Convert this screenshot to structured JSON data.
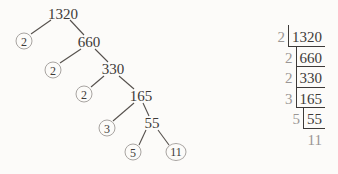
{
  "colors": {
    "bg": "#fcfbf9",
    "dark": "#3d3a38",
    "muted": "#9a9694",
    "line": "#55504c",
    "circle": "#a8a4a1"
  },
  "factor_tree": {
    "number": "1320",
    "prime_factors": [
      "2",
      "2",
      "2",
      "3",
      "5",
      "11"
    ],
    "nodes": [
      {
        "label": "1320",
        "kind": "composite"
      },
      {
        "label": "2",
        "kind": "prime"
      },
      {
        "label": "660",
        "kind": "composite"
      },
      {
        "label": "2",
        "kind": "prime"
      },
      {
        "label": "330",
        "kind": "composite"
      },
      {
        "label": "2",
        "kind": "prime"
      },
      {
        "label": "165",
        "kind": "composite"
      },
      {
        "label": "3",
        "kind": "prime"
      },
      {
        "label": "55",
        "kind": "composite"
      },
      {
        "label": "5",
        "kind": "prime"
      },
      {
        "label": "11",
        "kind": "prime"
      }
    ]
  },
  "division_ladder": {
    "rows": [
      {
        "divisor": "2",
        "dividend": "1320"
      },
      {
        "divisor": "2",
        "dividend": "660"
      },
      {
        "divisor": "2",
        "dividend": "330"
      },
      {
        "divisor": "3",
        "dividend": "165"
      },
      {
        "divisor": "5",
        "dividend": "55"
      }
    ],
    "final_quotient": "11"
  }
}
